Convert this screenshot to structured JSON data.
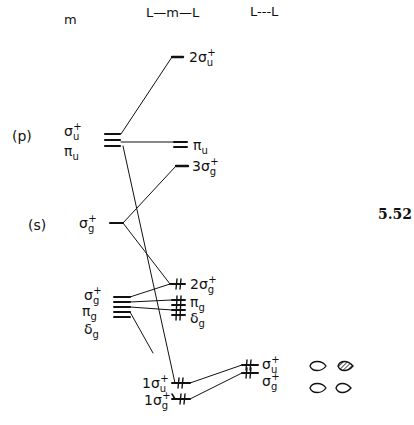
{
  "headers": {
    "metal": "m",
    "complex": "L—m—L",
    "ligands": "L---L"
  },
  "figure_number": "5.52",
  "metal": {
    "p_label": "(p)",
    "s_label": "(s)",
    "p_sym1": "σ",
    "p_sym1_sub": "u",
    "p_sym1_sup": "+",
    "p_sym2": "π",
    "p_sym2_sub": "u",
    "s_sym": "σ",
    "s_sym_sub": "g",
    "s_sym_sup": "+",
    "d_sym1": "σ",
    "d_sym1_sub": "g",
    "d_sym1_sup": "+",
    "d_sym2": "π",
    "d_sym2_sub": "g",
    "d_sym3": "δ",
    "d_sym3_sub": "g"
  },
  "complex": {
    "l2su": {
      "pre": "2σ",
      "sub": "u",
      "sup": "+"
    },
    "pu": {
      "pre": "π",
      "sub": "u"
    },
    "l3sg": {
      "pre": "3σ",
      "sub": "g",
      "sup": "+"
    },
    "l2sg": {
      "pre": "2σ",
      "sub": "g",
      "sup": "+"
    },
    "pg": {
      "pre": "π",
      "sub": "g"
    },
    "dg": {
      "pre": "δ",
      "sub": "g"
    },
    "l1su": {
      "pre": "1σ",
      "sub": "u",
      "sup": "+"
    },
    "l1sg": {
      "pre": "1σ",
      "sub": "g",
      "sup": "+"
    }
  },
  "ligands": {
    "su": {
      "pre": "σ",
      "sub": "u",
      "sup": "+"
    },
    "sg": {
      "pre": "σ",
      "sub": "g",
      "sup": "+"
    }
  },
  "colors": {
    "ink": "#111111"
  }
}
